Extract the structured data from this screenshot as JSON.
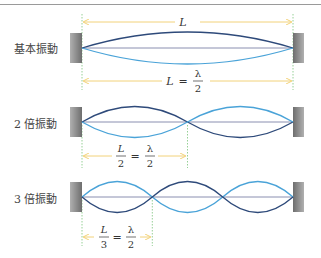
{
  "modes": [
    {
      "label": "基本振動",
      "formula_top": "L",
      "formula_bottom": {
        "left": "L",
        "eq": "=",
        "num": "λ",
        "den": "2"
      }
    },
    {
      "label": "2 倍振動",
      "formula": {
        "left_num": "L",
        "left_den": "2",
        "eq": "=",
        "num": "λ",
        "den": "2"
      }
    },
    {
      "label": "3 倍振動",
      "formula": {
        "left_num": "L",
        "left_den": "3",
        "eq": "=",
        "num": "λ",
        "den": "2"
      }
    }
  ],
  "colors": {
    "dark_wave": "#2e4a7a",
    "light_wave": "#4aa3d8",
    "string": "#8a8fb0",
    "arrow": "#f2d27a",
    "guide": "#7cc47c",
    "wall": "#808080"
  }
}
